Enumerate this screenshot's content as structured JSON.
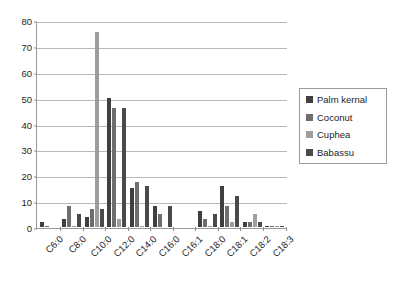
{
  "chart_data": {
    "type": "bar",
    "title": "",
    "xlabel": "",
    "ylabel": "",
    "ylim": [
      0,
      80
    ],
    "ytick_step": 10,
    "yticks": [
      "0",
      "10",
      "20",
      "30",
      "40",
      "50",
      "60",
      "70",
      "80"
    ],
    "grid": true,
    "legend_position": "right",
    "categories": [
      "C6:0",
      "C8:0",
      "C10:0",
      "C12:0",
      "C14:0",
      "C16:0",
      "C16:1",
      "C18:0",
      "C18:1",
      "C18:2",
      "C18:3"
    ],
    "series": [
      {
        "name": "Palm kernal",
        "color": "#3f3f3f",
        "values": [
          2,
          3,
          4,
          50,
          15,
          8,
          0,
          6,
          16,
          2,
          0.5
        ]
      },
      {
        "name": "Coconut",
        "color": "#6e6e6e",
        "values": [
          0.5,
          8,
          7,
          46,
          17.5,
          5,
          0,
          3,
          8,
          2,
          0.5
        ]
      },
      {
        "name": "Cuphea",
        "color": "#9e9e9e",
        "values": [
          0,
          0.5,
          75.5,
          3,
          0.5,
          0,
          0,
          0.5,
          2,
          5,
          0.5
        ]
      },
      {
        "name": "Babassu",
        "color": "#4a4a4a",
        "values": [
          0,
          5,
          7,
          46,
          16,
          8,
          0,
          5,
          12,
          2,
          0.5
        ]
      }
    ]
  }
}
